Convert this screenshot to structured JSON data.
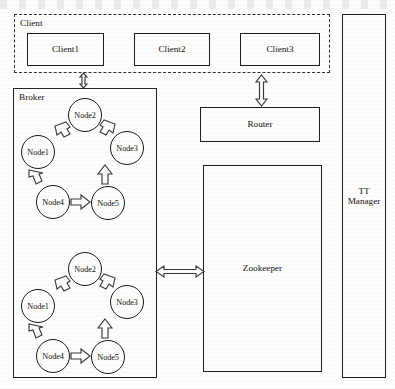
{
  "diagram": {
    "client_group": {
      "label": "Client",
      "clients": [
        {
          "label": "Client1"
        },
        {
          "label": "Client2"
        },
        {
          "label": "Client3"
        }
      ]
    },
    "broker_group": {
      "label": "Broker",
      "rings": [
        {
          "id": "ring-upper",
          "nodes": [
            {
              "label": "Node1"
            },
            {
              "label": "Node2"
            },
            {
              "label": "Node3"
            },
            {
              "label": "Node4"
            },
            {
              "label": "Node5"
            }
          ]
        },
        {
          "id": "ring-lower",
          "nodes": [
            {
              "label": "Node1"
            },
            {
              "label": "Node2"
            },
            {
              "label": "Node3"
            },
            {
              "label": "Node4"
            },
            {
              "label": "Node5"
            }
          ]
        }
      ]
    },
    "router": {
      "label": "Router"
    },
    "zookeeper": {
      "label": "Zookeeper"
    },
    "tt_manager": {
      "label": "TT\nManager"
    },
    "connectors": [
      {
        "id": "client1-broker",
        "kind": "double-vertical"
      },
      {
        "id": "client3-router",
        "kind": "double-vertical"
      },
      {
        "id": "broker-zookeeper",
        "kind": "double-horizontal"
      }
    ],
    "colors": {
      "stroke": "#1d1d1d",
      "arrow_stroke": "#3a3a3a",
      "background": "#fdfdfc"
    }
  }
}
